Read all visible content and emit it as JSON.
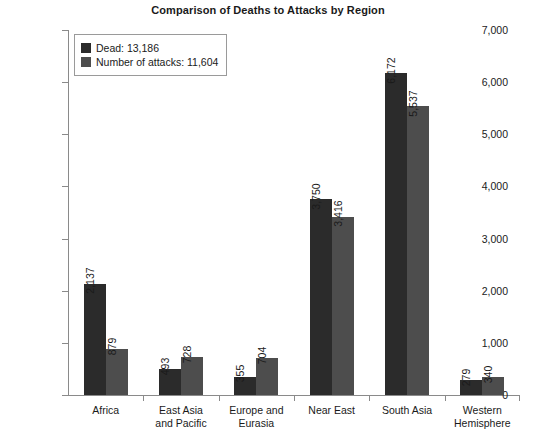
{
  "chart_data": {
    "type": "bar",
    "title": "Comparison of Deaths to Attacks by Region",
    "xlabel": "",
    "ylabel": "",
    "ylim": [
      0,
      7000
    ],
    "ytick_labels": [
      "0",
      "1,000",
      "2,000",
      "3,000",
      "4,000",
      "5,000",
      "6,000",
      "7,000"
    ],
    "ytick_values": [
      0,
      1000,
      2000,
      3000,
      4000,
      5000,
      6000,
      7000
    ],
    "grid": false,
    "legend_position": "upper-left-inside",
    "categories": [
      "Africa",
      "East Asia\nand Pacific",
      "Europe and\nEurasia",
      "Near East",
      "South Asia",
      "Western\nHemisphere"
    ],
    "series": [
      {
        "name": "Dead: 13,186",
        "short_name": "Dead",
        "total": 13186,
        "color": "#2b2b2b",
        "values": [
          2137,
          493,
          355,
          3750,
          6172,
          279
        ],
        "value_labels": [
          "2,137",
          "493",
          "355",
          "3,750",
          "6,172",
          "279"
        ]
      },
      {
        "name": "Number of attacks: 11,604",
        "short_name": "Number of attacks",
        "total": 11604,
        "color": "#4d4d4d",
        "values": [
          879,
          728,
          704,
          3416,
          5537,
          340
        ],
        "value_labels": [
          "879",
          "728",
          "704",
          "3,416",
          "5,537",
          "340"
        ]
      }
    ]
  }
}
